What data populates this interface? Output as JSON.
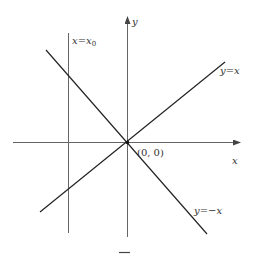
{
  "diagram": {
    "colors": {
      "axis": "#555555",
      "line": "#222222",
      "text": "#333333",
      "background": "#ffffff"
    },
    "axes": {
      "x_label": "x",
      "y_label": "y",
      "origin_label": "(0, 0)"
    },
    "lines": [
      {
        "id": "vertical",
        "label": "x = x₀",
        "label_main": "x=x",
        "label_sub": "0"
      },
      {
        "id": "diag-pos",
        "label": "y=x"
      },
      {
        "id": "diag-neg",
        "label": "y=−x"
      }
    ]
  }
}
